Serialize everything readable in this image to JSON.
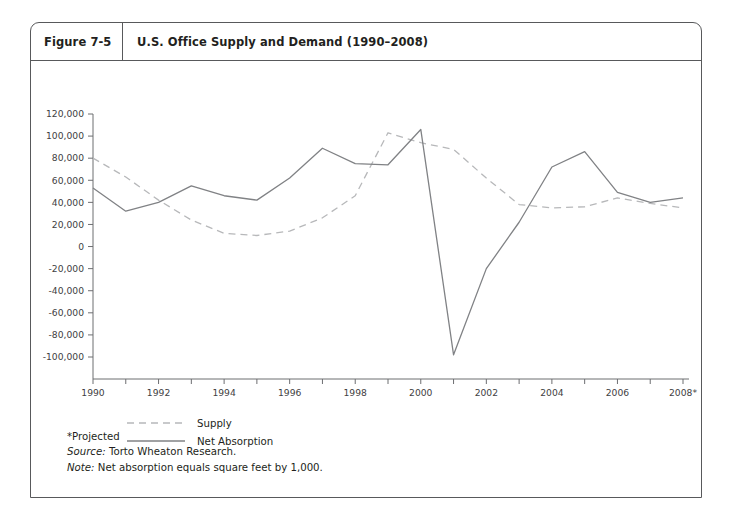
{
  "figure": {
    "number": "Figure 7-5",
    "title": "U.S. Office Supply and Demand (1990–2008)"
  },
  "footnotes": {
    "projected": "*Projected",
    "source_label": "Source:",
    "source_text": "Torto Wheaton Research.",
    "note_label": "Note:",
    "note_text": "Net absorption equals square feet by 1,000."
  },
  "colors": {
    "frame": "#58595b",
    "axis": "#6d6e71",
    "supply_line": "#b7b8ba",
    "absorption_line": "#808285",
    "text": "#231f20",
    "background": "#ffffff"
  },
  "chart_data": {
    "type": "line",
    "title": "U.S. Office Supply and Demand (1990–2008)",
    "xlabel": "",
    "ylabel": "",
    "x": [
      1990,
      1991,
      1992,
      1993,
      1994,
      1995,
      1996,
      1997,
      1998,
      1999,
      2000,
      2001,
      2002,
      2003,
      2004,
      2005,
      2006,
      2007,
      2008
    ],
    "x_tick_labels": [
      "1990",
      "",
      "1992",
      "",
      "1994",
      "",
      "1996",
      "",
      "1998",
      "",
      "2000",
      "",
      "2002",
      "",
      "2004",
      "",
      "2006",
      "",
      "2008*"
    ],
    "xlim": [
      1990,
      2008
    ],
    "ylim": [
      -100000,
      120000
    ],
    "y_ticks": [
      120000,
      100000,
      80000,
      60000,
      40000,
      20000,
      0,
      -20000,
      -40000,
      -60000,
      -80000,
      -100000
    ],
    "y_tick_labels": [
      "120,000",
      "100,000",
      "80,000",
      "60,000",
      "40,000",
      "20,000",
      "0",
      "-20,000",
      "-40,000",
      "-60,000",
      "-80,000",
      "-100,000"
    ],
    "grid": false,
    "legend_position": "below-axes-left",
    "series": [
      {
        "name": "Supply",
        "style": "dashed",
        "color": "#b7b8ba",
        "values": [
          80000,
          63000,
          42000,
          24000,
          12000,
          10000,
          14000,
          26000,
          46000,
          103000,
          94000,
          88000,
          62000,
          38000,
          35000,
          36000,
          44000,
          39000,
          35000
        ]
      },
      {
        "name": "Net Absorption",
        "style": "solid",
        "color": "#808285",
        "values": [
          53000,
          32000,
          40000,
          55000,
          46000,
          42000,
          62000,
          89000,
          75000,
          74000,
          106000,
          -98000,
          -20000,
          22000,
          72000,
          86000,
          49000,
          40000,
          44000
        ]
      }
    ]
  },
  "legend": [
    {
      "label": "Supply",
      "style": "dashed"
    },
    {
      "label": "Net Absorption",
      "style": "solid"
    }
  ]
}
